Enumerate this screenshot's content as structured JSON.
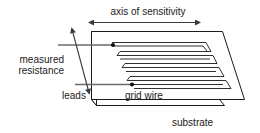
{
  "figure": {
    "type": "technical-line-diagram",
    "background_color": "#ffffff",
    "labels": {
      "axis_of_sensitivity": "axis of sensitivity",
      "measured_resistance_line1": "measured",
      "measured_resistance_line2": "resistance",
      "leads": "leads",
      "grid_wire": "grid wire",
      "substrate": "substrate"
    },
    "colors": {
      "outline": "#1a1a1a",
      "lead_line": "#6b6b6b",
      "arrow": "#3a3a3a",
      "text": "#1a1a1a",
      "fill": "#ffffff"
    },
    "parts": {
      "substrate_top_face": "parallelogram plate shown in oblique projection",
      "substrate_thickness_edges": "left and bottom edges drawn as thin slab sides",
      "grid_wire_pattern": "serpentine meander of four horizontal runs",
      "lead_terminals": "two solid dots where leads attach to grid wire",
      "axis_arrow": "horizontal double-headed arrow above the plate",
      "resistance_arrow": "diagonal double-headed arrow along the left edge"
    }
  }
}
